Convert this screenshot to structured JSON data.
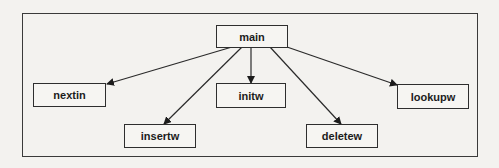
{
  "diagram": {
    "type": "call-tree",
    "root": "main",
    "nodes": [
      {
        "id": "main",
        "label": "main"
      },
      {
        "id": "nextin",
        "label": "nextin"
      },
      {
        "id": "insertw",
        "label": "insertw"
      },
      {
        "id": "initw",
        "label": "initw"
      },
      {
        "id": "deletew",
        "label": "deletew"
      },
      {
        "id": "lookupw",
        "label": "lookupw"
      }
    ],
    "edges": [
      {
        "from": "main",
        "to": "nextin"
      },
      {
        "from": "main",
        "to": "insertw"
      },
      {
        "from": "main",
        "to": "initw"
      },
      {
        "from": "main",
        "to": "deletew"
      },
      {
        "from": "main",
        "to": "lookupw"
      }
    ]
  }
}
